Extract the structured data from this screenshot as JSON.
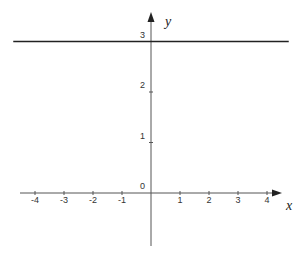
{
  "chart_data": {
    "type": "line",
    "title": "",
    "xlabel": "x",
    "ylabel": "y",
    "xlim": [
      -4.5,
      4.6
    ],
    "ylim": [
      -1.5,
      3.4
    ],
    "x_ticks": [
      -4,
      -3,
      -2,
      -1,
      1,
      2,
      3,
      4
    ],
    "x_tick_labels": [
      "-4",
      "-3",
      "-2",
      "-1",
      "1",
      "2",
      "3",
      "4"
    ],
    "y_ticks": [
      0,
      1,
      2,
      3
    ],
    "y_tick_labels": [
      "0",
      "1",
      "2",
      "3"
    ],
    "grid": false,
    "series": [
      {
        "name": "y = 3",
        "x": [
          -4.75,
          4.75
        ],
        "y": [
          3,
          3
        ],
        "color": "#222222"
      }
    ],
    "axis_color": "#555555"
  }
}
